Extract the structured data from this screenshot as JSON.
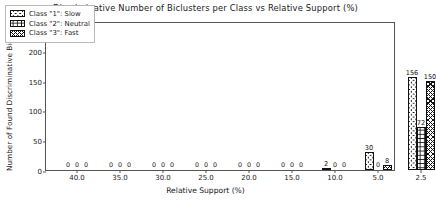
{
  "chart_data": {
    "type": "bar",
    "title": "Discriminative Number of Biclusters per Class vs Relative Support (%)",
    "xlabel": "Relative Support (%)",
    "ylabel": "Number of Found Discriminative Biclusters",
    "categories": [
      "40.0",
      "35.0",
      "30.0",
      "25.0",
      "20.0",
      "15.0",
      "10.0",
      "5.0",
      "2.5"
    ],
    "xticklabels": [
      "40.0",
      "35.0",
      "30.0",
      "25.0",
      "20.0",
      "15.0",
      "10.0",
      "5.0",
      "2.5"
    ],
    "yticklabels": [
      "0",
      "50",
      "100",
      "150",
      "200",
      "250"
    ],
    "ytickvalues": [
      0,
      50,
      100,
      150,
      200,
      250
    ],
    "ylim": [
      0,
      250
    ],
    "grid": false,
    "legend_position": "upper left",
    "series": [
      {
        "name": "Class \"1\": Slow",
        "hatch": "h-circle",
        "values": [
          0,
          0,
          0,
          0,
          0,
          0,
          2,
          30,
          156
        ]
      },
      {
        "name": "Class \"2\": Neutral",
        "hatch": "h-plus",
        "values": [
          0,
          0,
          0,
          0,
          0,
          0,
          0,
          0,
          72
        ]
      },
      {
        "name": "Class \"3\": Fast",
        "hatch": "h-cross",
        "values": [
          0,
          0,
          0,
          0,
          0,
          0,
          0,
          8,
          150
        ]
      }
    ]
  },
  "legend": {
    "items": [
      {
        "label": "Class \"1\": Slow",
        "hatch": "h-circle"
      },
      {
        "label": "Class \"2\": Neutral",
        "hatch": "h-plus"
      },
      {
        "label": "Class \"3\": Fast",
        "hatch": "h-cross"
      }
    ]
  }
}
